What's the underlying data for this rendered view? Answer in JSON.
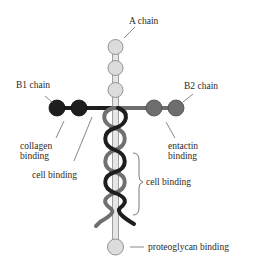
{
  "diagram": {
    "labels": {
      "a_chain": "A chain",
      "b1_chain": "B1 chain",
      "b2_chain": "B2 chain",
      "collagen_binding_1": "collagen",
      "collagen_binding_2": "binding",
      "entactin_binding_1": "entactin",
      "entactin_binding_2": "binding",
      "cell_binding_left": "cell binding",
      "cell_binding_right": "cell binding",
      "proteoglycan_binding": "proteoglycan binding"
    },
    "colors": {
      "a_chain": "#dcdcdc",
      "a_chain_stroke": "#8a8a8a",
      "b1_chain": "#1e1e1e",
      "b2_chain": "#6e6e6e",
      "leader": "#555555"
    }
  }
}
